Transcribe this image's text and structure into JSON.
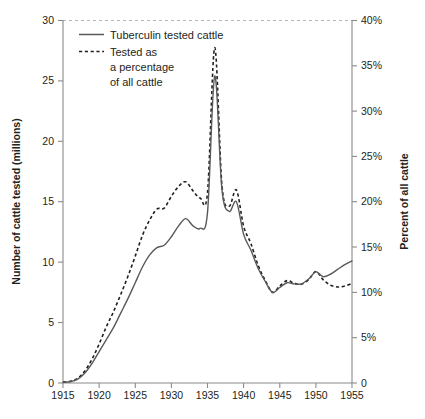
{
  "chart_data": {
    "type": "line",
    "title": "",
    "subtitle": "",
    "xlabel": "",
    "ylabel": "Number of cattle tested (millions)",
    "y2label": "Percent of all cattle",
    "xlim": [
      1915,
      1955
    ],
    "ylim": [
      0,
      30
    ],
    "y2lim": [
      0,
      40
    ],
    "grid": false,
    "legend_position": "top-left",
    "x_ticks": [
      1915,
      1920,
      1925,
      1930,
      1935,
      1940,
      1945,
      1950,
      1955
    ],
    "x_tick_labels": [
      "1915",
      "1920",
      "1925",
      "1930",
      "1935",
      "1940",
      "1945",
      "1950",
      "1955"
    ],
    "y_ticks": [
      0,
      5,
      10,
      15,
      20,
      25,
      30
    ],
    "y_tick_labels": [
      "0",
      "5",
      "10",
      "15",
      "20",
      "25",
      "30"
    ],
    "y2_ticks": [
      0,
      5,
      10,
      15,
      20,
      25,
      30,
      35,
      40
    ],
    "y2_tick_labels": [
      "0",
      "5%",
      "10%",
      "15%",
      "20%",
      "25%",
      "30%",
      "35%",
      "40%"
    ],
    "x": [
      1915,
      1916,
      1917,
      1918,
      1919,
      1920,
      1921,
      1922,
      1923,
      1924,
      1925,
      1926,
      1927,
      1928,
      1929,
      1930,
      1931,
      1932,
      1933,
      1934,
      1935,
      1936,
      1937,
      1938,
      1939,
      1940,
      1941,
      1942,
      1943,
      1944,
      1945,
      1946,
      1947,
      1948,
      1949,
      1950,
      1951,
      1952,
      1953,
      1954,
      1955
    ],
    "series": [
      {
        "name": "Tuberculin tested cattle",
        "axis": "left",
        "units": "millions",
        "style": "solid",
        "color": "#58595b",
        "values": [
          0.05,
          0.1,
          0.3,
          0.8,
          1.6,
          2.6,
          3.6,
          4.6,
          5.8,
          7.0,
          8.3,
          9.6,
          10.6,
          11.2,
          11.4,
          12.1,
          13.0,
          13.6,
          13.0,
          12.8,
          14.1,
          25.4,
          16.0,
          14.2,
          15.0,
          12.3,
          11.0,
          9.5,
          8.4,
          7.5,
          7.9,
          8.3,
          8.2,
          8.2,
          8.6,
          9.2,
          8.8,
          9.0,
          9.4,
          9.8,
          10.1
        ]
      },
      {
        "name": "Tested as a percentage of all cattle",
        "axis": "right",
        "units": "percent",
        "style": "dashed",
        "color": "#231f20",
        "values": [
          0.1,
          0.2,
          0.5,
          1.3,
          2.6,
          4.3,
          6.2,
          7.9,
          9.8,
          11.8,
          14.0,
          16.3,
          18.0,
          19.2,
          19.3,
          20.6,
          21.7,
          22.2,
          21.2,
          20.4,
          21.0,
          37.0,
          21.8,
          19.5,
          21.3,
          17.3,
          15.4,
          13.0,
          11.3,
          10.0,
          10.7,
          11.3,
          11.0,
          10.9,
          11.4,
          12.3,
          11.4,
          10.8,
          10.6,
          10.7,
          11.0
        ]
      }
    ],
    "annotations": []
  },
  "legend": {
    "entries": [
      {
        "label_lines": [
          "Tuberculin tested cattle"
        ],
        "style": "solid"
      },
      {
        "label_lines": [
          "Tested as",
          "a percentage",
          "of all cattle"
        ],
        "style": "dashed"
      }
    ],
    "entry1_line1": "Tuberculin tested cattle",
    "entry2_line1": "Tested as",
    "entry2_line2": "a percentage",
    "entry2_line3": "of all cattle"
  },
  "axis_titles": {
    "left": "Number of cattle tested (millions)",
    "right": "Percent of all cattle"
  },
  "colors": {
    "solid_series": "#58595b",
    "dashed_series": "#231f20",
    "axis": "#8a8a8a",
    "text": "#231f20",
    "background": "#ffffff"
  }
}
